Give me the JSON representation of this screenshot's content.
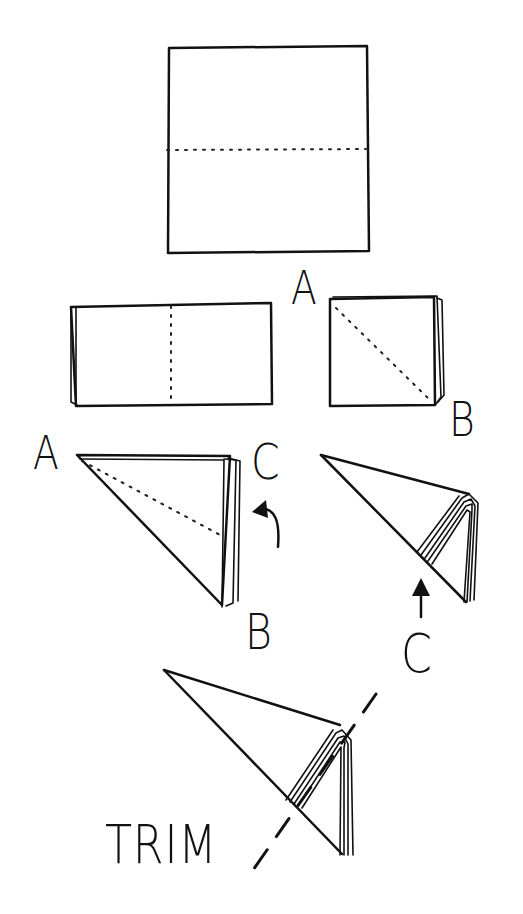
{
  "diagram": {
    "type": "paper-folding-instructions",
    "colors": {
      "ink": "#111111",
      "background": "#ffffff"
    },
    "steps": [
      {
        "id": "step-1",
        "shape": "square",
        "fold_line": "horizontal-dotted",
        "labels": [
          "A"
        ]
      },
      {
        "id": "step-2",
        "shape": "rectangle",
        "fold_line": "vertical-dotted",
        "labels": []
      },
      {
        "id": "step-3",
        "shape": "small-square",
        "fold_line": "diagonal-dotted",
        "labels": [
          "B"
        ]
      },
      {
        "id": "step-4",
        "shape": "triangle",
        "fold_line": "diagonal-dotted",
        "labels": [
          "A",
          "C",
          "B"
        ],
        "arrow": "curved-up-left"
      },
      {
        "id": "step-5",
        "shape": "cone",
        "labels": [
          "C"
        ],
        "arrow": "up"
      },
      {
        "id": "step-6",
        "shape": "cone",
        "cut_line": "dashed",
        "labels": [
          "TRIM"
        ]
      }
    ],
    "labels": {
      "step1_a": "A",
      "step3_b": "B",
      "step4_a": "A",
      "step4_c": "C",
      "step4_b": "B",
      "step5_c": "C",
      "step6_trim": "TRIM"
    }
  }
}
